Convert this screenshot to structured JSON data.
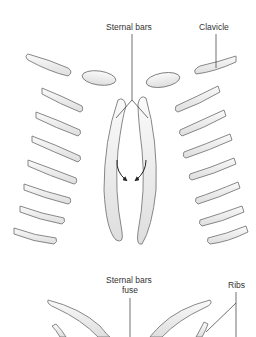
{
  "labels": {
    "sternal_bars": "Sternal bars",
    "clavicle": "Clavicle",
    "sternal_bars_fuse_line1": "Sternal bars",
    "sternal_bars_fuse_line2": "fuse",
    "ribs": "Ribs"
  },
  "colors": {
    "bone_fill": "#ededed",
    "bone_stroke": "#7a7a7a",
    "leader_line": "#333333",
    "arrow": "#222222"
  }
}
